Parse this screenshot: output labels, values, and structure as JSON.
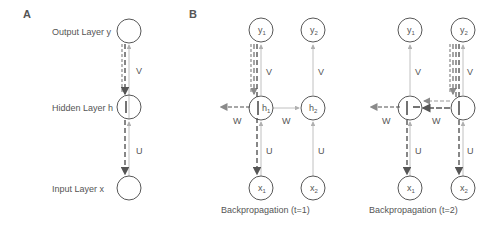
{
  "panels": {
    "a": {
      "letter": "A",
      "layers": {
        "output": "Output Layer y",
        "hidden": "Hidden Layer h",
        "input": "Input Layer x"
      },
      "weights": {
        "v": "V",
        "u": "U"
      }
    },
    "b": {
      "letter": "B",
      "caption": "Backpropagation (t=1)",
      "nodes": {
        "y1": "y",
        "y1_sub": "1",
        "y2": "y",
        "y2_sub": "2",
        "h1": "h",
        "h1_sub": "1",
        "h2": "h",
        "h2_sub": "2",
        "x1": "x",
        "x1_sub": "1",
        "x2": "x",
        "x2_sub": "2"
      },
      "weights": {
        "v1": "V",
        "v2": "V",
        "w_left": "W",
        "w_mid": "W",
        "u1": "U",
        "u2": "U"
      }
    },
    "c": {
      "caption": "Backpropagation (t=2)",
      "nodes": {
        "y1": "y",
        "y1_sub": "1",
        "y2": "y",
        "y2_sub": "2",
        "h1": "h",
        "h1_sub": "1",
        "h2": "h",
        "h2_sub": "2",
        "x1": "x",
        "x1_sub": "1",
        "x2": "x",
        "x2_sub": "2"
      },
      "weights": {
        "v1": "V",
        "v2": "V",
        "w_left": "W",
        "w_mid": "W",
        "u1": "U",
        "u2": "U"
      }
    }
  },
  "colors": {
    "node_stroke": "#444444",
    "forward_line": "#b0b0b0",
    "backprop_dark": "#555555",
    "backprop_light": "#9a9a9a",
    "text": "#555555"
  }
}
